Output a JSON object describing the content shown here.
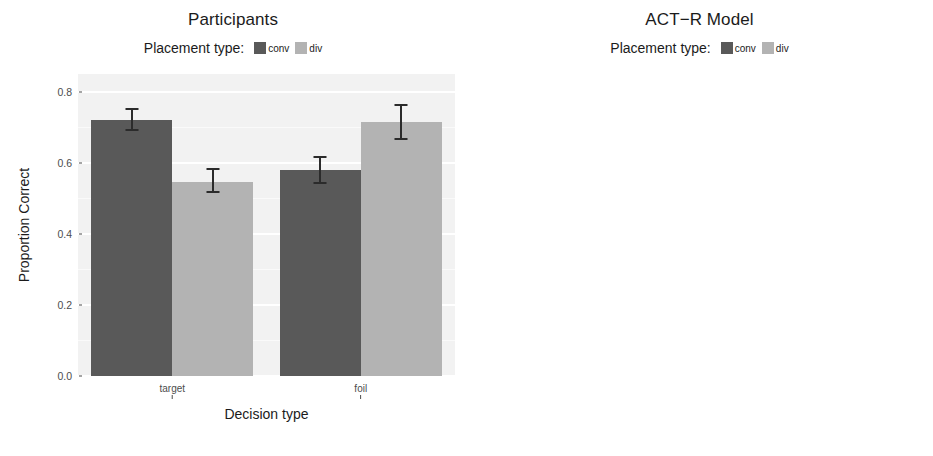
{
  "figure": {
    "width": 933,
    "height": 456,
    "background": "#ffffff"
  },
  "colors": {
    "conv": "#595959",
    "div": "#b3b3b3",
    "panel_background": "#f2f2f2",
    "grid": "#ffffff",
    "error_bar": "#2b2b2b",
    "text": "#1b1b1b",
    "tick_text": "#4d4d4d"
  },
  "legend": {
    "title": "Placement type:",
    "items": [
      {
        "label": "conv",
        "color": "#595959"
      },
      {
        "label": "div",
        "color": "#b3b3b3"
      }
    ]
  },
  "axes": {
    "xlabel": "Decision type",
    "ylabel": "Proportion Correct",
    "ylim": [
      0.0,
      0.85
    ],
    "yticks": [
      0.0,
      0.2,
      0.4,
      0.6,
      0.8
    ],
    "ytick_labels": [
      "0.0",
      "0.2",
      "0.4",
      "0.6",
      "0.8"
    ],
    "xtick_labels": [
      "target",
      "foil"
    ]
  },
  "chart_data": [
    {
      "type": "bar",
      "title": "Participants",
      "xlabel": "Decision type",
      "ylabel": "Proportion Correct",
      "ylim": [
        0.0,
        0.85
      ],
      "yticks": [
        0.0,
        0.2,
        0.4,
        0.6,
        0.8
      ],
      "categories": [
        "target",
        "foil"
      ],
      "legend": "Placement type:",
      "legend_position": "top",
      "grid": true,
      "series": [
        {
          "name": "conv",
          "color": "#595959",
          "values": [
            0.72,
            0.58
          ],
          "error_low": [
            0.69,
            0.54
          ],
          "error_high": [
            0.755,
            0.62
          ]
        },
        {
          "name": "div",
          "color": "#b3b3b3",
          "values": [
            0.545,
            0.715
          ],
          "error_low": [
            0.515,
            0.665
          ],
          "error_high": [
            0.585,
            0.765
          ]
        }
      ]
    },
    {
      "type": "bar",
      "title": "ACT−R Model",
      "xlabel": "Decision type",
      "ylabel": "Proportion Correct",
      "ylim": [
        0.0,
        0.85
      ],
      "yticks": [
        0.0,
        0.2,
        0.4,
        0.6,
        0.8
      ],
      "categories": [
        "target",
        "foil"
      ],
      "legend": "Placement type:",
      "legend_position": "top",
      "grid": true,
      "series": [
        {
          "name": "conv",
          "color": "#595959",
          "values": [
            0.765,
            0.588
          ],
          "error_low": [
            null,
            null
          ],
          "error_high": [
            null,
            null
          ]
        },
        {
          "name": "div",
          "color": "#b3b3b3",
          "values": [
            0.588,
            0.725
          ],
          "error_low": [
            null,
            null
          ],
          "error_high": [
            null,
            null
          ]
        }
      ]
    }
  ]
}
